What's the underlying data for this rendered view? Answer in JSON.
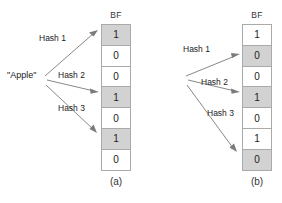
{
  "diagram": {
    "panels": [
      {
        "caption": "(a)",
        "term": "\"Apple\"",
        "bf_header": "BF",
        "hashes": [
          "Hash 1",
          "Hash 2",
          "Hash 3"
        ],
        "bits": [
          "1",
          "0",
          "0",
          "1",
          "0",
          "1",
          "0"
        ],
        "highlighted_rows": [
          0,
          3,
          5
        ]
      },
      {
        "caption": "(b)",
        "term": "\"Orange\"",
        "bf_header": "BF",
        "hashes": [
          "Hash 1",
          "Hash 2",
          "Hash 3"
        ],
        "bits": [
          "1",
          "0",
          "0",
          "1",
          "0",
          "1",
          "0"
        ],
        "highlighted_rows": [
          1,
          3,
          6
        ]
      }
    ],
    "colors": {
      "cell_shaded": "#d2d2d2",
      "cell_plain": "#ffffff",
      "border": "#aaaaaa",
      "arrow": "#7b7b7b",
      "text": "#222222",
      "background": "#ffffff"
    }
  }
}
